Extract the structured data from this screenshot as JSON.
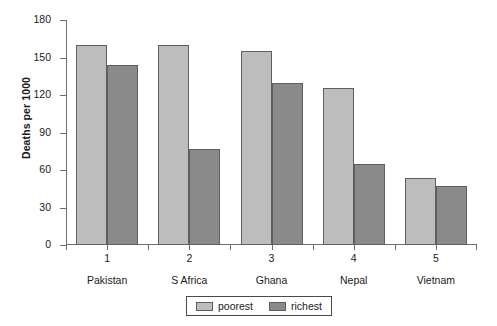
{
  "chart_data": {
    "type": "bar",
    "title": "",
    "xlabel": "",
    "ylabel": "Deaths per 1000",
    "ylim": [
      0,
      180
    ],
    "yticks": [
      0,
      30,
      60,
      90,
      120,
      150,
      180
    ],
    "grid": false,
    "legend_position": "bottom-center",
    "categories": [
      "Pakistan",
      "S Africa",
      "Ghana",
      "Nepal",
      "Vietnam"
    ],
    "category_numbers": [
      "1",
      "2",
      "3",
      "4",
      "5"
    ],
    "series": [
      {
        "name": "poorest",
        "color": "#bdbdbd",
        "values": [
          160,
          160,
          155,
          126,
          54
        ]
      },
      {
        "name": "richest",
        "color": "#8a8a8a",
        "values": [
          144,
          77,
          130,
          65,
          47
        ]
      }
    ]
  },
  "axis": {
    "y_title": "Deaths per 1000",
    "y_tick_labels": [
      "180",
      "150",
      "120",
      "90",
      "60",
      "30",
      "0"
    ]
  },
  "legend": {
    "entries": [
      {
        "label": "poorest"
      },
      {
        "label": "richest"
      }
    ]
  }
}
